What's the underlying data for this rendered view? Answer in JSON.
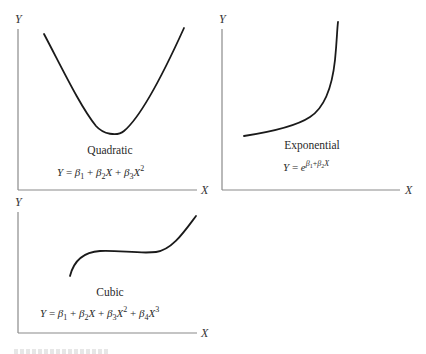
{
  "figure": {
    "panels": [
      {
        "id": "quadratic",
        "name": "Quadratic",
        "equation": {
          "lhs": "Y",
          "terms": [
            "β1",
            "β2X",
            "β3X²"
          ],
          "display": "Y = β₁ + β₂X + β₃X²"
        },
        "axes": {
          "x": "X",
          "y": "Y"
        },
        "shape": "U-shaped parabola with minimum near center"
      },
      {
        "id": "exponential",
        "name": "Exponential",
        "equation": {
          "lhs": "Y",
          "base": "e",
          "exponent": "β1+β2X",
          "display": "Y = e^(β₁+β₂X)"
        },
        "axes": {
          "x": "X",
          "y": "Y"
        },
        "shape": "slowly increasing then sharply rising curve"
      },
      {
        "id": "cubic",
        "name": "Cubic",
        "equation": {
          "lhs": "Y",
          "terms": [
            "β1",
            "β2X",
            "β3X²",
            "β4X³"
          ],
          "display": "Y = β₁ + β₂X + β₃X² + β₄X³"
        },
        "axes": {
          "x": "X",
          "y": "Y"
        },
        "shape": "S-shaped curve rising, flattening, then rising again"
      }
    ]
  },
  "labels": {
    "y": "Y",
    "x": "X",
    "eq": "=",
    "plus": "+",
    "beta": "β",
    "e": "e",
    "sub1": "1",
    "sub2": "2",
    "sub3": "3",
    "sub4": "4",
    "sup2": "2",
    "sup3": "3"
  }
}
